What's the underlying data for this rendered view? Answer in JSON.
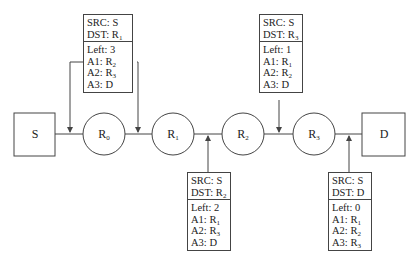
{
  "nodes": {
    "source": {
      "label": "S"
    },
    "routers": [
      {
        "name": "R",
        "sub": "0"
      },
      {
        "name": "R",
        "sub": "1"
      },
      {
        "name": "R",
        "sub": "2"
      },
      {
        "name": "R",
        "sub": "3"
      }
    ],
    "destination": {
      "label": "D"
    }
  },
  "packets": [
    {
      "position": "above S–R0 and R0–R1",
      "src": "SRC: S",
      "dst": {
        "prefix": "DST: ",
        "name": "R",
        "sub": "1"
      },
      "left": "Left: 3",
      "hops": [
        {
          "prefix": "A1: ",
          "name": "R",
          "sub": "2"
        },
        {
          "prefix": "A2: ",
          "name": "R",
          "sub": "3"
        },
        {
          "prefix": "A3: ",
          "name": "D",
          "sub": ""
        }
      ]
    },
    {
      "position": "below R1–R2",
      "src": "SRC: S",
      "dst": {
        "prefix": "DST: ",
        "name": "R",
        "sub": "2"
      },
      "left": "Left: 2",
      "hops": [
        {
          "prefix": "A1: ",
          "name": "R",
          "sub": "1"
        },
        {
          "prefix": "A2: ",
          "name": "R",
          "sub": "3"
        },
        {
          "prefix": "A3: ",
          "name": "D",
          "sub": ""
        }
      ]
    },
    {
      "position": "above R2–R3",
      "src": "SRC: S",
      "dst": {
        "prefix": "DST: ",
        "name": "R",
        "sub": "3"
      },
      "left": "Left: 1",
      "hops": [
        {
          "prefix": "A1: ",
          "name": "R",
          "sub": "1"
        },
        {
          "prefix": "A2: ",
          "name": "R",
          "sub": "2"
        },
        {
          "prefix": "A3: ",
          "name": "D",
          "sub": ""
        }
      ]
    },
    {
      "position": "below R3–D",
      "src": "SRC: S",
      "dst": {
        "prefix": "DST: ",
        "name": "D",
        "sub": ""
      },
      "left": "Left: 0",
      "hops": [
        {
          "prefix": "A1: ",
          "name": "R",
          "sub": "1"
        },
        {
          "prefix": "A2: ",
          "name": "R",
          "sub": "2"
        },
        {
          "prefix": "A3: ",
          "name": "R",
          "sub": "3"
        }
      ]
    }
  ],
  "colors": {
    "stroke": "#444444",
    "background": "#ffffff",
    "text": "#222222"
  }
}
